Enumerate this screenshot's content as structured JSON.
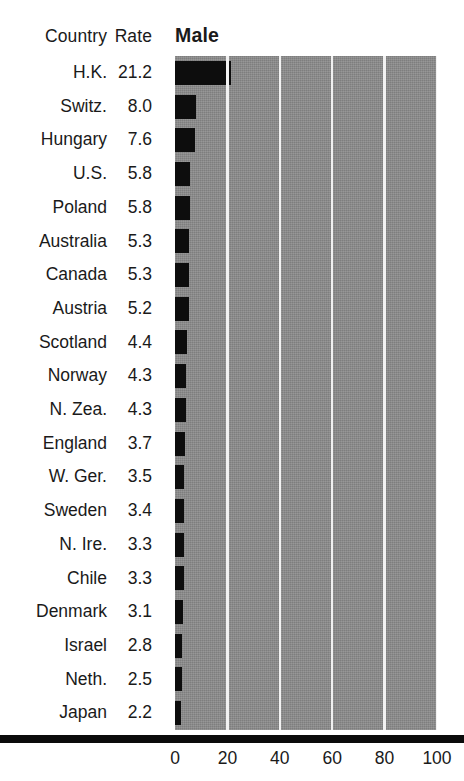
{
  "table": {
    "country_header": "Country",
    "rate_header": "Rate"
  },
  "series_title": "Male",
  "axis": {
    "ticks": [
      "0",
      "20",
      "40",
      "60",
      "80",
      "100"
    ]
  },
  "colors": {
    "bar": "#0d0d0d",
    "plot_background": "#8b8b8b",
    "gridline": "#f2f2f2",
    "axis_rule": "#0b0b0b",
    "text": "#1a1a1a"
  },
  "chart_data": {
    "type": "bar",
    "title": "Male",
    "xlabel": "",
    "ylabel": "",
    "orientation": "horizontal",
    "xlim": [
      0,
      100
    ],
    "xticks": [
      0,
      20,
      40,
      60,
      80,
      100
    ],
    "grid": true,
    "legend": false,
    "categories": [
      "H.K.",
      "Switz.",
      "Hungary",
      "U.S.",
      "Poland",
      "Australia",
      "Canada",
      "Austria",
      "Scotland",
      "Norway",
      "N. Zea.",
      "England",
      "W. Ger.",
      "Sweden",
      "N. Ire.",
      "Chile",
      "Denmark",
      "Israel",
      "Neth.",
      "Japan"
    ],
    "values": [
      21.2,
      8.0,
      7.6,
      5.8,
      5.8,
      5.3,
      5.3,
      5.2,
      4.4,
      4.3,
      4.3,
      3.7,
      3.5,
      3.4,
      3.3,
      3.3,
      3.1,
      2.8,
      2.5,
      2.2
    ],
    "value_labels": [
      "21.2",
      "8.0",
      "7.6",
      "5.8",
      "5.8",
      "5.3",
      "5.3",
      "5.2",
      "4.4",
      "4.3",
      "4.3",
      "3.7",
      "3.5",
      "3.4",
      "3.3",
      "3.3",
      "3.1",
      "2.8",
      "2.5",
      "2.2"
    ]
  }
}
